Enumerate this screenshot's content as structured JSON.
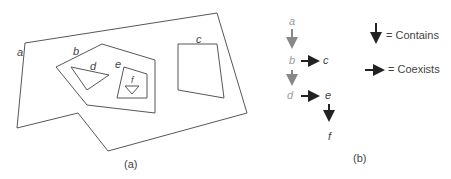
{
  "figure_a": {
    "caption": "(a)",
    "regions": [
      {
        "id": "a",
        "label": "a"
      },
      {
        "id": "b",
        "label": "b"
      },
      {
        "id": "c",
        "label": "c"
      },
      {
        "id": "d",
        "label": "d"
      },
      {
        "id": "e",
        "label": "e"
      },
      {
        "id": "f",
        "label": "f"
      }
    ]
  },
  "figure_b": {
    "caption": "(b)",
    "nodes": [
      {
        "id": "a",
        "label": "a"
      },
      {
        "id": "b",
        "label": "b"
      },
      {
        "id": "c",
        "label": "c"
      },
      {
        "id": "d",
        "label": "d"
      },
      {
        "id": "e",
        "label": "e"
      },
      {
        "id": "f",
        "label": "f"
      }
    ],
    "edges": [
      {
        "from": "a",
        "to": "b",
        "type": "contains"
      },
      {
        "from": "b",
        "to": "d",
        "type": "contains"
      },
      {
        "from": "b",
        "to": "c",
        "type": "coexists"
      },
      {
        "from": "d",
        "to": "e",
        "type": "coexists"
      },
      {
        "from": "e",
        "to": "f",
        "type": "contains"
      }
    ]
  },
  "legend": {
    "contains_label": "= Contains",
    "coexists_label": "= Coexists"
  }
}
